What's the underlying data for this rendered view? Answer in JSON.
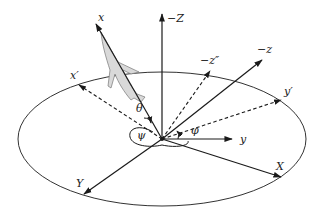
{
  "diagram": {
    "type": "aircraft-attitude-coordinate-frames",
    "colors": {
      "line": "#1a1a1a",
      "aircraft_fill": "#d9d9d9",
      "aircraft_stroke": "#777777",
      "background": "#ffffff"
    },
    "origin": {
      "x": 162,
      "y": 139
    },
    "ground_plane": {
      "cx": 162,
      "cy": 139,
      "rx": 144,
      "ry": 67
    },
    "axes": [
      {
        "id": "minus-Z",
        "label": "−Z",
        "style": "solid",
        "end": [
          162,
          14
        ],
        "label_pos": [
          167,
          22
        ]
      },
      {
        "id": "x",
        "label": "x",
        "style": "solid",
        "end": [
          96,
          24
        ],
        "label_pos": [
          98,
          21
        ]
      },
      {
        "id": "x-prime",
        "label": "x′",
        "style": "dashed",
        "end": [
          79,
          85
        ],
        "label_pos": [
          70,
          79
        ]
      },
      {
        "id": "minus-z-double-prime",
        "label": "−z″",
        "style": "dashed",
        "end": [
          210,
          71
        ],
        "label_pos": [
          200,
          64
        ]
      },
      {
        "id": "minus-z",
        "label": "−z",
        "style": "solid",
        "end": [
          262,
          60
        ],
        "label_pos": [
          257,
          53
        ]
      },
      {
        "id": "y-prime",
        "label": "y′",
        "style": "dashed",
        "end": [
          281,
          100
        ],
        "label_pos": [
          284,
          95
        ]
      },
      {
        "id": "y",
        "label": "y",
        "style": "solid",
        "end": [
          232,
          139
        ],
        "label_pos": [
          240,
          143
        ]
      },
      {
        "id": "X",
        "label": "X",
        "style": "solid",
        "end": [
          281,
          177
        ],
        "label_pos": [
          276,
          170
        ]
      },
      {
        "id": "Y",
        "label": "Y",
        "style": "solid",
        "end": [
          84,
          194
        ],
        "label_pos": [
          76,
          187
        ]
      }
    ],
    "angles": [
      {
        "id": "theta",
        "label": "θ",
        "label_pos": [
          136,
          112
        ]
      },
      {
        "id": "psi",
        "label": "ψ",
        "label_pos": [
          137,
          134
        ]
      },
      {
        "id": "phi",
        "label": "φ",
        "label_pos": [
          191,
          134
        ]
      }
    ]
  }
}
